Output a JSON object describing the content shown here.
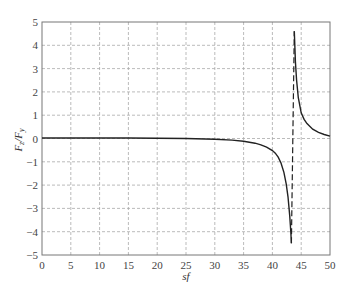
{
  "chart_data": {
    "type": "line",
    "title": "",
    "xlabel": "sf",
    "ylabel": "F_z/F_y",
    "xlim": [
      0,
      50
    ],
    "ylim": [
      -5,
      5
    ],
    "grid": true,
    "legend": null,
    "x_ticks": [
      0,
      5,
      10,
      15,
      20,
      25,
      30,
      35,
      40,
      45,
      50
    ],
    "y_ticks": [
      -5,
      -4,
      -3,
      -2,
      -1,
      0,
      1,
      2,
      3,
      4,
      5
    ],
    "x_tick_labels": [
      "0",
      "5",
      "10",
      "15",
      "20",
      "25",
      "30",
      "35",
      "40",
      "45",
      "50"
    ],
    "y_tick_labels": [
      "−5",
      "−4",
      "−3",
      "−2",
      "−1",
      "0",
      "1",
      "2",
      "3",
      "4",
      "5"
    ],
    "series": [
      {
        "name": "F_z/F_y (lower branch)",
        "style": "solid",
        "x": [
          0,
          5,
          10,
          15,
          20,
          25,
          30,
          33,
          35,
          37,
          38,
          39,
          40,
          40.5,
          41,
          41.5,
          42,
          42.4,
          42.7,
          43,
          43.2,
          43.3
        ],
        "y": [
          0.02,
          0.02,
          0.02,
          0.02,
          0.01,
          0.0,
          -0.03,
          -0.07,
          -0.12,
          -0.2,
          -0.27,
          -0.37,
          -0.52,
          -0.63,
          -0.8,
          -1.05,
          -1.45,
          -1.95,
          -2.5,
          -3.3,
          -4.0,
          -4.5
        ]
      },
      {
        "name": "F_z/F_y (upper branch)",
        "style": "solid",
        "x": [
          43.8,
          43.9,
          44.0,
          44.2,
          44.5,
          45,
          45.5,
          46,
          47,
          48,
          49,
          50
        ],
        "y": [
          4.6,
          3.9,
          3.3,
          2.5,
          1.75,
          1.1,
          0.82,
          0.64,
          0.4,
          0.26,
          0.17,
          0.1
        ]
      },
      {
        "name": "asymptote",
        "style": "dashed",
        "x": [
          43.3,
          43.8
        ],
        "y": [
          -4.5,
          4.6
        ]
      }
    ]
  }
}
